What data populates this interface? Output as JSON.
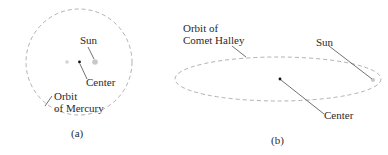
{
  "panel_a": {
    "caption": "(a)",
    "labels": {
      "sun": "Sun",
      "center": "Center",
      "orbit_line1": "Orbit",
      "orbit_line2": "of Mercury"
    }
  },
  "panel_b": {
    "caption": "(b)",
    "labels": {
      "orbit_line1": "Orbit of",
      "orbit_line2": "Comet Halley",
      "sun": "Sun",
      "center": "Center"
    }
  },
  "colors": {
    "orbit": "#a8a8a8",
    "sun": "#c8c8c8",
    "center_dot": "#111111",
    "leader": "#333333"
  }
}
